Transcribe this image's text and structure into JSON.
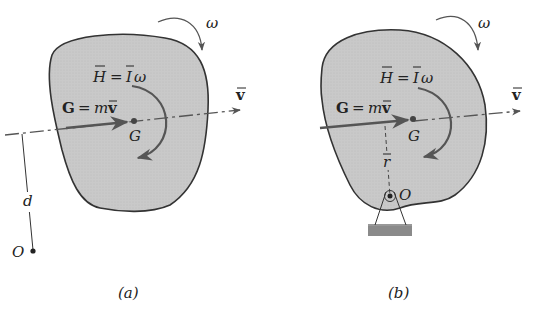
{
  "panels": [
    {
      "id": "a",
      "caption": "(a)",
      "labels": {
        "omega": "ω",
        "angular_momentum": "H̄ = Īω",
        "H": "H",
        "eq1": "=",
        "I": "I",
        "w": "ω",
        "linear_momentum_G": "G",
        "linear_momentum_eq": "=",
        "linear_momentum_m": "m",
        "linear_momentum_v": "v",
        "velocity": "v",
        "center": "G",
        "distance": "d",
        "point": "O"
      }
    },
    {
      "id": "b",
      "caption": "(b)",
      "labels": {
        "omega": "ω",
        "H": "H",
        "eq1": "=",
        "I": "I",
        "w": "ω",
        "linear_momentum_G": "G",
        "linear_momentum_eq": "=",
        "linear_momentum_m": "m",
        "linear_momentum_v": "v",
        "velocity": "v",
        "center": "G",
        "radius": "r",
        "pivot": "O"
      }
    }
  ],
  "colors": {
    "body_fill": "#c8c8c8",
    "outline": "#333333",
    "arrow": "#555555",
    "support": "#8a8a8a"
  }
}
